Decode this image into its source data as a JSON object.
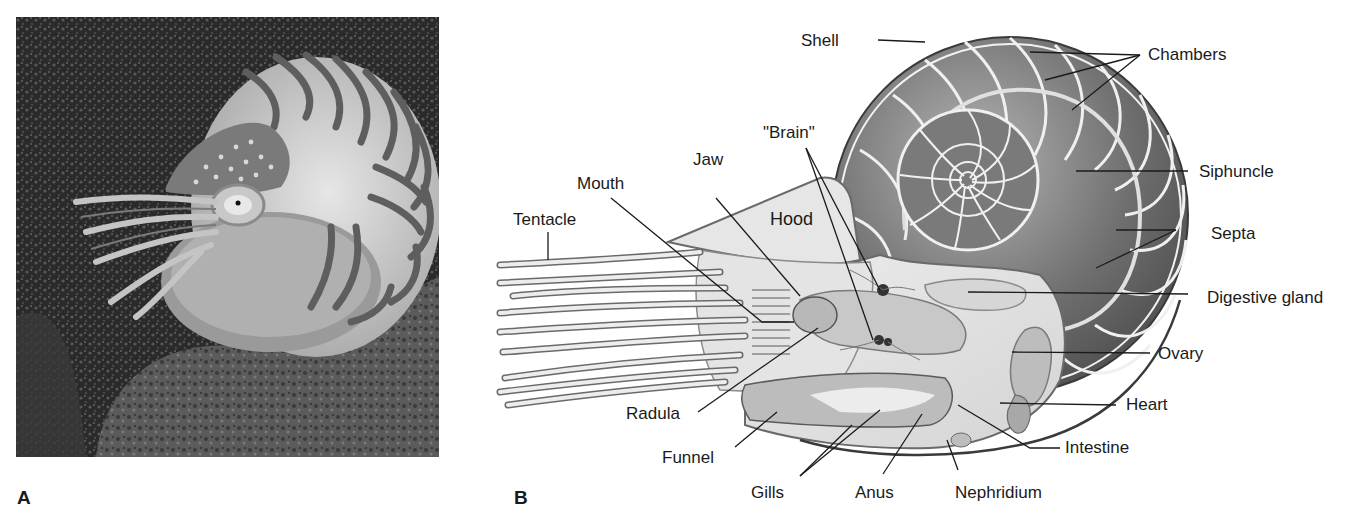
{
  "figure": {
    "panels": [
      {
        "id": "A",
        "letter": "A",
        "kind": "photograph",
        "subject": "chambered nautilus on reef"
      },
      {
        "id": "B",
        "letter": "B",
        "kind": "anatomical-diagram",
        "subject": "nautilus internal anatomy"
      }
    ]
  },
  "panel_b": {
    "hood_label": "Hood",
    "labels": {
      "shell": "Shell",
      "chambers": "Chambers",
      "brain": "\"Brain\"",
      "jaw": "Jaw",
      "mouth": "Mouth",
      "tentacle": "Tentacle",
      "siphuncle": "Siphuncle",
      "septa": "Septa",
      "digestive_gland": "Digestive gland",
      "ovary": "Ovary",
      "heart": "Heart",
      "intestine": "Intestine",
      "radula": "Radula",
      "funnel": "Funnel",
      "gills": "Gills",
      "anus": "Anus",
      "nephridium": "Nephridium"
    }
  },
  "colors": {
    "ink": "#1a1a1a",
    "shell_dark": "#5a5a5a",
    "shell_mid": "#8a8a8a",
    "body_light": "#e2e2e2",
    "photo_bg": "#1c1c1c"
  }
}
